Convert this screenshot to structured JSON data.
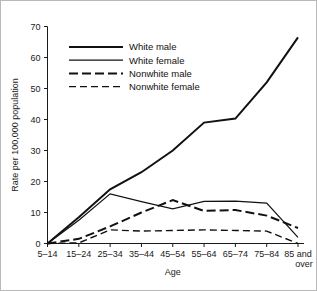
{
  "chart_data": {
    "type": "line",
    "title": "",
    "xlabel": "Age",
    "ylabel": "Rate per 100,000 population",
    "categories": [
      "5-14",
      "15-24",
      "25-34",
      "35-44",
      "45-54",
      "55-64",
      "65-74",
      "75-84",
      "85 and over"
    ],
    "x_tick_labels": [
      "5–14",
      "15–24",
      "25–34",
      "35–44",
      "45–54",
      "55–64",
      "65–74",
      "75–84",
      "85 and"
    ],
    "x_tick_label_second_line": "over",
    "ylim": [
      0,
      70
    ],
    "y_ticks": [
      0,
      10,
      20,
      30,
      40,
      50,
      60,
      70
    ],
    "y_tick_labels": [
      "0",
      "10",
      "20",
      "30",
      "40",
      "50",
      "60",
      "70"
    ],
    "grid": false,
    "legend_position": "upper-left-inside",
    "series": [
      {
        "name": "White male",
        "style": "solid-thick",
        "stroke_width": 2.0,
        "dash": "none",
        "color": "#111111",
        "values": [
          0,
          8.5,
          17.5,
          23,
          30,
          39,
          40.3,
          52,
          66.5
        ]
      },
      {
        "name": "White female",
        "style": "solid-thin",
        "stroke_width": 1.2,
        "dash": "none",
        "color": "#111111",
        "values": [
          0,
          7.5,
          16,
          13.5,
          11.2,
          13.6,
          13.7,
          13,
          2
        ]
      },
      {
        "name": "Nonwhite male",
        "style": "dashed-thick",
        "stroke_width": 2.0,
        "dash": "9,4",
        "color": "#111111",
        "values": [
          0,
          1.5,
          5.5,
          10,
          14,
          10.5,
          10.8,
          9,
          5
        ]
      },
      {
        "name": "Nonwhite female",
        "style": "dashed-thin",
        "stroke_width": 1.4,
        "dash": "7,4",
        "color": "#111111",
        "values": [
          0,
          0.2,
          4.4,
          4.0,
          4.2,
          4.4,
          4.2,
          4.0,
          0
        ]
      }
    ]
  },
  "legend": {
    "entries": [
      {
        "label": "White male"
      },
      {
        "label": "White female"
      },
      {
        "label": "Nonwhite male"
      },
      {
        "label": "Nonwhite female"
      }
    ]
  },
  "colors": {
    "ink": "#111111",
    "background": "#ffffff",
    "border": "#b9b9b9"
  }
}
